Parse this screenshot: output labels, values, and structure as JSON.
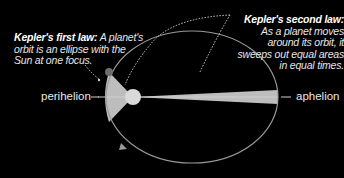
{
  "diagram": {
    "first_law": {
      "heading": "Kepler's first law:",
      "text": "A planet's orbit is an ellipse with the Sun at one focus."
    },
    "second_law": {
      "heading": "Kepler's second law:",
      "text": "As a planet moves around its orbit, it sweeps out equal areas in equal times."
    },
    "labels": {
      "perihelion": "perihelion",
      "aphelion": "aphelion"
    },
    "colors": {
      "background": "#000000",
      "orbit": "#9a9a9a",
      "swept_area": "#bdbdbd",
      "sun": "#d9d9d9",
      "planet": "#6e6e6e",
      "text": "#e6e6e6"
    },
    "elements": [
      "elliptical-orbit",
      "sun",
      "planet",
      "perihelion-swept-area",
      "aphelion-swept-area",
      "orbit-direction-arrow",
      "dotted-callout-leaders"
    ]
  }
}
